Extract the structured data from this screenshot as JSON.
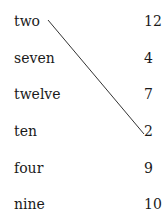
{
  "left_items": [
    "two",
    "seven",
    "twelve",
    "ten",
    "four",
    "nine"
  ],
  "right_items": [
    "12",
    "4",
    "7",
    "2",
    "9",
    "10"
  ],
  "connections": [
    {
      "from": "two",
      "to": "2"
    }
  ],
  "line_color": "#333333"
}
